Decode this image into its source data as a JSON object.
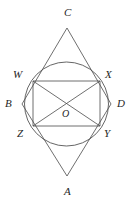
{
  "figure": {
    "canvas": {
      "width": 135,
      "height": 203,
      "background": "#ffffff"
    },
    "style": {
      "stroke_color": "#4a4a4a",
      "label_color": "#262626",
      "stroke_width": 0.8
    },
    "circle": {
      "name": "inscribed-circle",
      "cx": 66.5,
      "cy": 104,
      "r": 42
    },
    "points": [
      {
        "id": "C",
        "label": "C",
        "x": 67,
        "y": 28,
        "label_x": 64,
        "label_y": 16,
        "role": "top-apex"
      },
      {
        "id": "A",
        "label": "A",
        "x": 67,
        "y": 176,
        "label_x": 64,
        "label_y": 195,
        "role": "bottom-apex"
      },
      {
        "id": "B",
        "label": "B",
        "x": 22,
        "y": 104,
        "label_x": 5,
        "label_y": 107,
        "role": "left-vertex"
      },
      {
        "id": "D",
        "label": "D",
        "x": 111,
        "y": 104,
        "label_x": 117,
        "label_y": 107,
        "role": "right-vertex"
      },
      {
        "id": "W",
        "label": "W",
        "x": 33,
        "y": 81,
        "label_x": 13,
        "label_y": 78,
        "role": "rect-top-left"
      },
      {
        "id": "X",
        "label": "X",
        "x": 100,
        "y": 81,
        "label_x": 105,
        "label_y": 78,
        "role": "rect-top-right"
      },
      {
        "id": "Z",
        "label": "Z",
        "x": 33,
        "y": 126,
        "label_x": 17,
        "label_y": 137,
        "role": "rect-bottom-left"
      },
      {
        "id": "Y",
        "label": "Y",
        "x": 100,
        "y": 126,
        "label_x": 104,
        "label_y": 137,
        "role": "rect-bottom-right"
      },
      {
        "id": "O",
        "label": "O",
        "x": 66.5,
        "y": 104,
        "label_x": 62,
        "label_y": 117,
        "role": "center"
      }
    ],
    "segments": [
      {
        "name": "segment-C-B",
        "from": "C",
        "to": "B"
      },
      {
        "name": "segment-C-D",
        "from": "C",
        "to": "D"
      },
      {
        "name": "segment-A-B",
        "from": "A",
        "to": "B"
      },
      {
        "name": "segment-A-D",
        "from": "A",
        "to": "D"
      },
      {
        "name": "segment-W-X",
        "from": "W",
        "to": "X"
      },
      {
        "name": "segment-X-Y",
        "from": "X",
        "to": "Y"
      },
      {
        "name": "segment-Y-Z",
        "from": "Y",
        "to": "Z"
      },
      {
        "name": "segment-Z-W",
        "from": "Z",
        "to": "W"
      },
      {
        "name": "diagonal-W-Y",
        "from": "W",
        "to": "Y"
      },
      {
        "name": "diagonal-X-Z",
        "from": "X",
        "to": "Z"
      }
    ],
    "labels": {
      "C": "C",
      "A": "A",
      "B": "B",
      "D": "D",
      "W": "W",
      "X": "X",
      "Y": "Y",
      "Z": "Z",
      "O": "O"
    }
  }
}
